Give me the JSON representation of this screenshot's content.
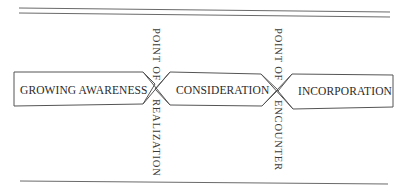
{
  "diagram": {
    "stages": [
      {
        "id": "growing-awareness",
        "label": "GROWING AWARENESS"
      },
      {
        "id": "consideration",
        "label": "CONSIDERATION"
      },
      {
        "id": "incorporation",
        "label": "INCORPORATION"
      }
    ],
    "transitions": [
      {
        "id": "point-of-realization",
        "top": "POINT OF",
        "bottom": "REALIZATION"
      },
      {
        "id": "point-of-encounter",
        "top": "POINT OF",
        "bottom": "ENCOUNTER"
      }
    ],
    "colors": {
      "line": "#555555",
      "text": "#2a2a2a",
      "background": "#ffffff"
    }
  }
}
